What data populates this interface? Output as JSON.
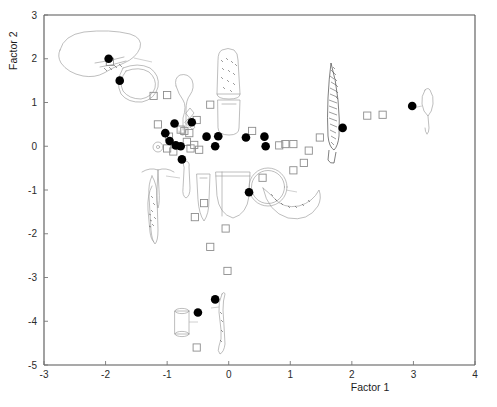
{
  "figure": {
    "background_color": "#ffffff",
    "plot_frame_color": "#555555",
    "filled_marker_color": "#000000",
    "open_marker_color": "#8d8d8d",
    "artifact_outline_color": "#9a9a9a"
  },
  "chart_data": {
    "type": "scatter",
    "title": "",
    "xlabel": "Factor 1",
    "ylabel": "Factor 2",
    "xlim": [
      -3,
      4
    ],
    "ylim": [
      -5,
      3
    ],
    "xticks": [
      -3,
      -2,
      -1,
      0,
      1,
      2,
      3,
      4
    ],
    "xtick_labels": [
      "-3",
      "-2",
      "-1",
      "0",
      "1",
      "2",
      "3",
      "4"
    ],
    "yticks": [
      -5,
      -4,
      -3,
      -2,
      -1,
      0,
      1,
      2,
      3
    ],
    "ytick_labels": [
      "-5",
      "-4",
      "-3",
      "-2",
      "-1",
      "0",
      "1",
      "2",
      "3"
    ],
    "grid": false,
    "legend": null,
    "series": [
      {
        "name": "filled-circles",
        "marker": "filled-circle",
        "color": "#000000",
        "points": [
          [
            -1.95,
            2.0
          ],
          [
            -1.77,
            1.5
          ],
          [
            -0.88,
            0.52
          ],
          [
            -1.03,
            0.3
          ],
          [
            -0.96,
            0.12
          ],
          [
            -0.86,
            0.02
          ],
          [
            -0.78,
            0.0
          ],
          [
            -0.6,
            0.55
          ],
          [
            -0.76,
            -0.3
          ],
          [
            -0.36,
            0.22
          ],
          [
            -0.17,
            0.23
          ],
          [
            -0.22,
            0.0
          ],
          [
            0.28,
            0.2
          ],
          [
            0.58,
            0.22
          ],
          [
            0.6,
            0.0
          ],
          [
            0.33,
            -1.05
          ],
          [
            1.85,
            0.42
          ],
          [
            2.98,
            0.92
          ],
          [
            -0.22,
            -3.5
          ],
          [
            -0.5,
            -3.8
          ]
        ]
      },
      {
        "name": "open-squares",
        "marker": "open-square",
        "color": "#8d8d8d",
        "points": [
          [
            -1.93,
            1.93
          ],
          [
            -1.22,
            1.15
          ],
          [
            -1.0,
            1.17
          ],
          [
            -1.15,
            0.5
          ],
          [
            -0.97,
            0.22
          ],
          [
            -1.0,
            -0.05
          ],
          [
            -0.9,
            -0.12
          ],
          [
            -0.78,
            0.38
          ],
          [
            -0.72,
            0.35
          ],
          [
            -0.64,
            0.3
          ],
          [
            -0.68,
            0.1
          ],
          [
            -0.62,
            -0.05
          ],
          [
            -0.56,
            0.03
          ],
          [
            -0.48,
            -0.08
          ],
          [
            -0.52,
            0.6
          ],
          [
            -0.3,
            0.95
          ],
          [
            0.38,
            0.35
          ],
          [
            0.82,
            0.02
          ],
          [
            0.92,
            0.05
          ],
          [
            1.05,
            0.05
          ],
          [
            1.3,
            -0.1
          ],
          [
            1.22,
            -0.38
          ],
          [
            1.05,
            -0.55
          ],
          [
            1.48,
            0.2
          ],
          [
            2.25,
            0.7
          ],
          [
            2.5,
            0.72
          ],
          [
            0.55,
            -0.72
          ],
          [
            -0.4,
            -1.3
          ],
          [
            -0.55,
            -1.62
          ],
          [
            -0.05,
            -1.88
          ],
          [
            -0.3,
            -2.3
          ],
          [
            -0.02,
            -2.85
          ],
          [
            -0.52,
            -4.6
          ]
        ]
      }
    ],
    "artifacts": [
      {
        "name": "large-bowl-rim-sherd",
        "x": -2.35,
        "y": 2.45
      },
      {
        "name": "ring-vessel-profile",
        "x": -1.45,
        "y": 1.8
      },
      {
        "name": "ladle-handle-profile",
        "x": -0.78,
        "y": 1.35
      },
      {
        "name": "stippled-jar-body",
        "x": -0.02,
        "y": 1.95
      },
      {
        "name": "jar-base-profile",
        "x": -0.02,
        "y": 1.05
      },
      {
        "name": "small-bead-cluster",
        "x": -0.52,
        "y": 0.95
      },
      {
        "name": "spindle-whorl",
        "x": -1.0,
        "y": 0.2
      },
      {
        "name": "awl-tool-profile",
        "x": -1.22,
        "y": -0.28
      },
      {
        "name": "bone-point-profile",
        "x": -1.02,
        "y": -1.35
      },
      {
        "name": "pestle-profile",
        "x": -0.72,
        "y": -0.75
      },
      {
        "name": "tall-beaker-profile",
        "x": -0.32,
        "y": -0.8
      },
      {
        "name": "deep-bowl-profile",
        "x": 0.02,
        "y": -0.78
      },
      {
        "name": "circular-disc-object",
        "x": 0.58,
        "y": -0.62
      },
      {
        "name": "crescent-decorated-rim",
        "x": 1.12,
        "y": -1.05
      },
      {
        "name": "dark-spearhead-blade",
        "x": 1.7,
        "y": 0.85
      },
      {
        "name": "long-pin-profile",
        "x": 3.15,
        "y": 1.0
      },
      {
        "name": "small-cylinder-vessel",
        "x": -0.72,
        "y": -3.82
      },
      {
        "name": "worked-bone-strip",
        "x": -0.1,
        "y": -3.85
      },
      {
        "name": "notched-handle-fragment",
        "x": -1.02,
        "y": -2.6
      }
    ]
  }
}
